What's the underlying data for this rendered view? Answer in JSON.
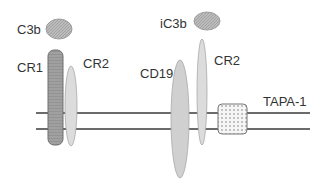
{
  "diagram": {
    "type": "membrane-receptor-complex",
    "membrane": {
      "color": "#3a3a3a",
      "upper_y": 113,
      "lower_y": 129,
      "x_start": 36,
      "x_end": 310
    },
    "labels": {
      "c3b": "C3b",
      "cr1": "CR1",
      "cr2_left": "CR2",
      "ic3b": "iC3b",
      "cd19": "CD19",
      "cr2_right": "CR2",
      "tapa1": "TAPA-1"
    },
    "complexes": [
      {
        "name": "CR1/CR2 complex",
        "ligand": "C3b",
        "members": [
          "CR1",
          "CR2"
        ]
      },
      {
        "name": "CD19/CR2/TAPA-1 complex",
        "ligand": "iC3b",
        "members": [
          "CD19",
          "CR2",
          "TAPA-1"
        ]
      }
    ],
    "colors": {
      "ligand_fill": "#b8b8b8",
      "cr1_fill": "#9a9a9a",
      "cr2_fill": "#dcdcdc",
      "cd19_fill": "#d0d0d0",
      "tapa_fill": "#f2f2f2",
      "outline": "#8a8a8a"
    }
  }
}
